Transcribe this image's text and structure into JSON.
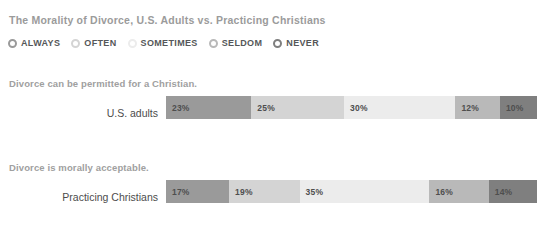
{
  "chart_title": "The Morality of Divorce, U.S. Adults vs. Practicing Christians",
  "legend": {
    "items": [
      {
        "label": "ALWAYS",
        "color": "#9a9a9a",
        "icon": "radio-circle-icon"
      },
      {
        "label": "OFTEN",
        "color": "#d4d4d4",
        "icon": "radio-circle-icon"
      },
      {
        "label": "SOMETIMES",
        "color": "#ececec",
        "icon": "radio-circle-icon"
      },
      {
        "label": "SELDOM",
        "color": "#b9b9b9",
        "icon": "radio-circle-icon"
      },
      {
        "label": "NEVER",
        "color": "#7f7f7f",
        "icon": "radio-circle-icon"
      }
    ]
  },
  "sections": [
    {
      "heading": "Divorce can be permitted for a Christian.",
      "row_label": "U.S. adults",
      "segments": [
        {
          "label": "23%",
          "value": 23,
          "color": "#9a9a9a"
        },
        {
          "label": "25%",
          "value": 25,
          "color": "#d4d4d4"
        },
        {
          "label": "30%",
          "value": 30,
          "color": "#ececec"
        },
        {
          "label": "12%",
          "value": 12,
          "color": "#b9b9b9"
        },
        {
          "label": "10%",
          "value": 10,
          "color": "#7f7f7f"
        }
      ]
    },
    {
      "heading": "Divorce is morally acceptable.",
      "row_label": "Practicing Christians",
      "segments": [
        {
          "label": "17%",
          "value": 17,
          "color": "#9a9a9a"
        },
        {
          "label": "19%",
          "value": 19,
          "color": "#d4d4d4"
        },
        {
          "label": "35%",
          "value": 35,
          "color": "#ececec"
        },
        {
          "label": "16%",
          "value": 16,
          "color": "#b9b9b9"
        },
        {
          "label": "14%",
          "value": 14,
          "color": "#7f7f7f"
        }
      ]
    }
  ],
  "chart_data": {
    "type": "bar",
    "subtype": "stacked-horizontal-100pct",
    "title": "The Morality of Divorce, U.S. Adults vs. Practicing Christians",
    "xlabel": "",
    "ylabel": "",
    "xlim": [
      0,
      100
    ],
    "grid": false,
    "legend_position": "top",
    "categories": [
      "U.S. adults",
      "Practicing Christians"
    ],
    "series": [
      {
        "name": "ALWAYS",
        "color": "#9a9a9a",
        "values": [
          23,
          17
        ]
      },
      {
        "name": "OFTEN",
        "color": "#d4d4d4",
        "values": [
          25,
          19
        ]
      },
      {
        "name": "SOMETIMES",
        "color": "#ececec",
        "values": [
          30,
          35
        ]
      },
      {
        "name": "SELDOM",
        "color": "#b9b9b9",
        "values": [
          12,
          16
        ]
      },
      {
        "name": "NEVER",
        "color": "#7f7f7f",
        "values": [
          10,
          14
        ]
      }
    ],
    "annotations": [
      "Divorce can be permitted for a Christian.",
      "Divorce is morally acceptable."
    ]
  }
}
